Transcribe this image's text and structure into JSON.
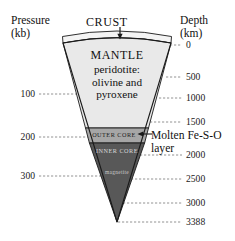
{
  "figure": {
    "background": "#ffffff"
  },
  "axes": {
    "pressure": {
      "header": "Pressure\n(kb)",
      "unit": "kb",
      "ticks": [
        {
          "label": "100",
          "value": 100,
          "y": 94
        },
        {
          "label": "200",
          "value": 200,
          "y": 137
        },
        {
          "label": "300",
          "value": 300,
          "y": 176
        }
      ]
    },
    "depth": {
      "header": "Depth\n(km)",
      "unit": "km",
      "ticks": [
        {
          "label": "0",
          "value": 0,
          "y": 45
        },
        {
          "label": "500",
          "value": 500,
          "y": 77
        },
        {
          "label": "1000",
          "value": 1000,
          "y": 98
        },
        {
          "label": "1500",
          "value": 1500,
          "y": 122
        },
        {
          "label": "2000",
          "value": 2000,
          "y": 155
        },
        {
          "label": "2500",
          "value": 2500,
          "y": 179
        },
        {
          "label": "3000",
          "value": 3000,
          "y": 203
        },
        {
          "label": "3388",
          "value": 3388,
          "y": 222
        }
      ]
    }
  },
  "layers": {
    "crust": {
      "name": "CRUST",
      "callout": "CRUST",
      "color": "#f2f2f2"
    },
    "mantle": {
      "name": "MANTLE",
      "composition": "peridotite:\nolivine and\npyroxene",
      "color": "#e9e9e9"
    },
    "outer_core": {
      "name": "OUTER CORE",
      "color": "#a6a6a6"
    },
    "inner_core": {
      "name": "INNER CORE",
      "color": "#585858"
    },
    "inner_core_mineral": {
      "name": "magnetite",
      "color": "#585858"
    }
  },
  "annotations": {
    "molten_layer": "Molten Fe-S-O\nlayer"
  },
  "colors": {
    "outline": "#1a1a1a",
    "tick_line": "#6b6b6b",
    "text": "#1a1a1a"
  }
}
